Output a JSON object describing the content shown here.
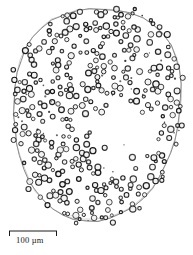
{
  "figure": {
    "type": "micrograph-tracing",
    "background_color": "#ffffff",
    "outline_color": "#6f6f6f",
    "granule_stroke_color": "#141414",
    "granule_fill_color": "#f2f2f2",
    "dot_color": "#2a2a2a"
  },
  "scalebar": {
    "label": "100 µm",
    "value": 100,
    "unit": "µm",
    "bar_color": "#1a1a1a",
    "x_start": 9,
    "x_end": 57,
    "y": 231,
    "tick_height": 5
  },
  "outline": {
    "points": [
      [
        101,
        9
      ],
      [
        116,
        10
      ],
      [
        130,
        13
      ],
      [
        143,
        18
      ],
      [
        154,
        25
      ],
      [
        163,
        34
      ],
      [
        171,
        45
      ],
      [
        176,
        57
      ],
      [
        179,
        70
      ],
      [
        181,
        84
      ],
      [
        181,
        98
      ],
      [
        180,
        112
      ],
      [
        178,
        126
      ],
      [
        175,
        140
      ],
      [
        171,
        153
      ],
      [
        166,
        165
      ],
      [
        160,
        177
      ],
      [
        152,
        188
      ],
      [
        143,
        198
      ],
      [
        133,
        207
      ],
      [
        122,
        213
      ],
      [
        110,
        218
      ],
      [
        98,
        221
      ],
      [
        86,
        221
      ],
      [
        74,
        219
      ],
      [
        63,
        215
      ],
      [
        53,
        209
      ],
      [
        44,
        201
      ],
      [
        36,
        192
      ],
      [
        29,
        181
      ],
      [
        24,
        169
      ],
      [
        20,
        156
      ],
      [
        17,
        143
      ],
      [
        15,
        129
      ],
      [
        14,
        115
      ],
      [
        14,
        101
      ],
      [
        15,
        87
      ],
      [
        17,
        73
      ],
      [
        21,
        60
      ],
      [
        26,
        48
      ],
      [
        33,
        37
      ],
      [
        42,
        28
      ],
      [
        52,
        20
      ],
      [
        64,
        15
      ],
      [
        77,
        11
      ],
      [
        89,
        9
      ]
    ],
    "inner_points": [
      [
        152,
        189
      ],
      [
        143,
        199
      ],
      [
        132,
        207
      ],
      [
        120,
        213
      ],
      [
        108,
        217
      ],
      [
        95,
        219
      ],
      [
        83,
        219
      ],
      [
        71,
        216
      ]
    ]
  },
  "granules": {
    "count_rings": 352,
    "count_dots": 34,
    "radius_range": [
      1.5,
      3.2
    ],
    "clusters": [
      {
        "name": "upper-band",
        "cx": 95,
        "cy": 45
      },
      {
        "name": "left-dense",
        "cx": 55,
        "cy": 110
      },
      {
        "name": "lower-band",
        "cx": 100,
        "cy": 175
      },
      {
        "name": "right-arc",
        "cx": 160,
        "cy": 80
      },
      {
        "name": "right-lower-arc",
        "cx": 165,
        "cy": 160
      }
    ],
    "void": {
      "name": "central-clearing",
      "cx": 128,
      "cy": 130,
      "rx": 38,
      "ry": 40
    }
  }
}
